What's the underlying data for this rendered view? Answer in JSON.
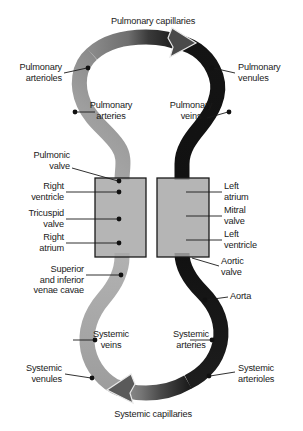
{
  "diagram": {
    "title_present": false,
    "background_color": "#ffffff",
    "colors": {
      "oxygen_poor_vessel": "#9a9a9a",
      "oxygen_rich_vessel": "#141414",
      "chamber_box_fill": "#a8a8a8",
      "chamber_box_stroke": "#1a1a1a",
      "leader_line": "#1a1a1a",
      "marker_dot": "#111111",
      "text": "#1a1a1a"
    },
    "labels": {
      "pulmonary_capillaries": "Pulmonary capillaries",
      "pulmonary_arterioles": "Pulmonary\narterioles",
      "pulmonary_venules": "Pulmonary\nvenules",
      "pulmonary_arteries": "Pulmonary\narteries",
      "pulmonary_veins": "Pulmonary\nveins",
      "pulmonic_valve": "Pulmonic\nvalve",
      "right_ventricle": "Right\nventricle",
      "tricuspid_valve": "Tricuspid\nvalve",
      "right_atrium": "Right\natrium",
      "left_atrium": "Left\natrium",
      "mitral_valve": "Mitral\nvalve",
      "left_ventricle": "Left\nventricle",
      "aortic_valve": "Aortic\nvalve",
      "venae_cavae": "Superior\nand inferior\nvenae cavae",
      "aorta": "Aorta",
      "systemic_veins": "Systemic\nveins",
      "systemic_arteries": "Systemic\narteries",
      "systemic_venules": "Systemic\nvenules",
      "systemic_arterioles": "Systemic\narterioles",
      "systemic_capillaries": "Systemic capillaries"
    },
    "flow": {
      "top_arrow_direction": "right",
      "bottom_arrow_direction": "left"
    }
  }
}
